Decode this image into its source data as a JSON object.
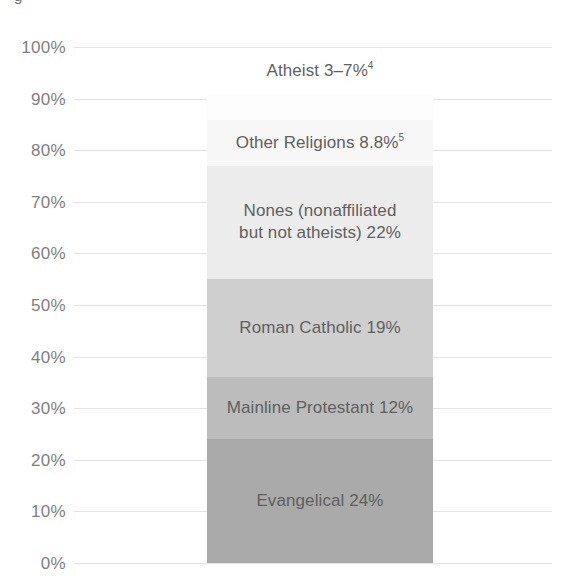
{
  "clipped_caption": "g",
  "chart_data": {
    "type": "bar",
    "subtype": "stacked-single-bar-100-percent",
    "title": "",
    "subtitle": "",
    "xlabel": "",
    "ylabel": "",
    "categories": [
      ""
    ],
    "ylim": [
      0,
      100
    ],
    "ytick_labels": [
      "100%",
      "90%",
      "80%",
      "70%",
      "60%",
      "50%",
      "40%",
      "30%",
      "20%",
      "10%",
      "0%"
    ],
    "ytick_values": [
      100,
      90,
      80,
      70,
      60,
      50,
      40,
      30,
      20,
      10,
      0
    ],
    "grid": true,
    "grid_color": "#e3e3e3",
    "legend": false,
    "legend_position": "none",
    "stack_order": "bottom-to-top",
    "segments": [
      {
        "name": "Evangelical",
        "value": 24,
        "value_text": "24%",
        "label": "Evangelical 24%",
        "label_lines": [
          "Evangelical 24%"
        ],
        "footnote": "",
        "color": "#aaaaaa",
        "label_inside": true
      },
      {
        "name": "Mainline Protestant",
        "value": 12,
        "value_text": "12%",
        "label": "Mainline Protestant 12%",
        "label_lines": [
          "Mainline Protestant 12%"
        ],
        "footnote": "",
        "color": "#bcbcbc",
        "label_inside": true
      },
      {
        "name": "Roman Catholic",
        "value": 19,
        "value_text": "19%",
        "label": "Roman Catholic 19%",
        "label_lines": [
          "Roman Catholic 19%"
        ],
        "footnote": "",
        "color": "#cfcfcf",
        "label_inside": true
      },
      {
        "name": "Nones (nonaffiliated but not atheists)",
        "value": 22,
        "value_text": "22%",
        "label": "Nones (nonaffiliated\nbut not atheists) 22%",
        "label_lines": [
          "Nones (nonaffiliated",
          "but not atheists) 22%"
        ],
        "footnote": "",
        "color": "#ececec",
        "label_inside": true
      },
      {
        "name": "Other Religions",
        "value": 8.8,
        "value_text": "8.8%",
        "label": "Other Religions 8.8%",
        "label_lines": [
          "Other Religions 8.8%"
        ],
        "footnote": "5",
        "color": "#f7f7f7",
        "label_inside": true
      },
      {
        "name": "Atheist",
        "value": 5,
        "value_text": "3–7%",
        "value_range": [
          3,
          7
        ],
        "label": "Atheist 3–7%",
        "label_lines": [
          "Atheist 3–7%"
        ],
        "footnote": "4",
        "color": "#fdfdfd",
        "label_inside": false
      }
    ]
  }
}
